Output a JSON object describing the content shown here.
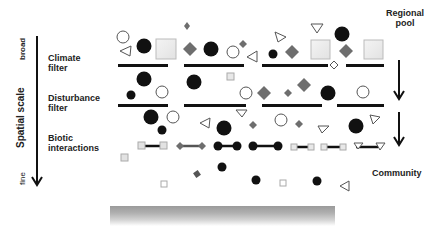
{
  "axis": {
    "title": "Spatial scale",
    "top_label": "broad",
    "bottom_label": "fine"
  },
  "filters": [
    {
      "label_line1": "Climate",
      "label_line2": "filter"
    },
    {
      "label_line1": "Disturbance",
      "label_line2": "filter"
    },
    {
      "label_line1": "Biotic",
      "label_line2": "interactions"
    }
  ],
  "right_labels": {
    "top_line1": "Regional",
    "top_line2": "pool",
    "bottom": "Community"
  },
  "legend_shapes": [
    "filled-circle",
    "open-circle",
    "open-triangle",
    "grey-diamond",
    "light-square"
  ],
  "colors": {
    "black": "#111111",
    "grey_diamond": "#6e6e6e",
    "light_square_fill": "#ececec",
    "light_square_border": "#b8b8b8",
    "ground": "#a0a0a0"
  }
}
